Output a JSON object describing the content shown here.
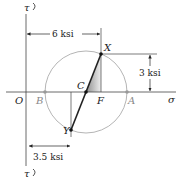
{
  "diagram": {
    "type": "mohr-circle",
    "axes": {
      "horizontal_label": "σ",
      "vertical_label_top": "τ",
      "vertical_label_bottom": "τ",
      "origin_label": "O"
    },
    "points": {
      "X": "X",
      "Y": "Y",
      "C": "C",
      "F": "F",
      "A": "A",
      "B": "B"
    },
    "dimensions": {
      "top": "6 ksi",
      "right": "3 ksi",
      "bottom": "3.5 ksi"
    },
    "colors": {
      "line": "#222222",
      "circle": "#b0b0b0",
      "shade_dark": "#9a9a9a",
      "shade_light": "#e8e8e8"
    }
  }
}
